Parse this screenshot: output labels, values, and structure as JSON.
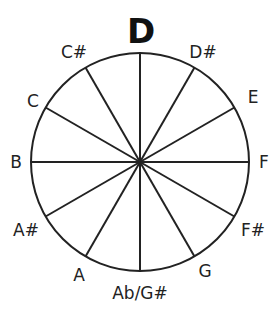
{
  "diagram": {
    "title": "D",
    "center": {
      "x": 140,
      "y": 162
    },
    "radius": 109,
    "stroke_color": "#222222",
    "stroke_width": 2,
    "spoke_count": 12
  },
  "labels": [
    {
      "id": "d-sharp",
      "text": "D#",
      "x": 203,
      "y": 52
    },
    {
      "id": "e",
      "text": "E",
      "x": 253,
      "y": 97
    },
    {
      "id": "f",
      "text": "F",
      "x": 264,
      "y": 162
    },
    {
      "id": "f-sharp",
      "text": "F#",
      "x": 253,
      "y": 230
    },
    {
      "id": "g",
      "text": "G",
      "x": 205,
      "y": 271
    },
    {
      "id": "ab-g-sharp",
      "text": "Ab/G#",
      "x": 140,
      "y": 293
    },
    {
      "id": "a",
      "text": "A",
      "x": 79,
      "y": 275
    },
    {
      "id": "a-sharp",
      "text": "A#",
      "x": 26,
      "y": 230
    },
    {
      "id": "b",
      "text": "B",
      "x": 16,
      "y": 162
    },
    {
      "id": "c",
      "text": "C",
      "x": 33,
      "y": 101
    },
    {
      "id": "c-sharp",
      "text": "C#",
      "x": 74,
      "y": 52
    }
  ],
  "root": {
    "text": "D",
    "x": 141,
    "y": 31
  }
}
